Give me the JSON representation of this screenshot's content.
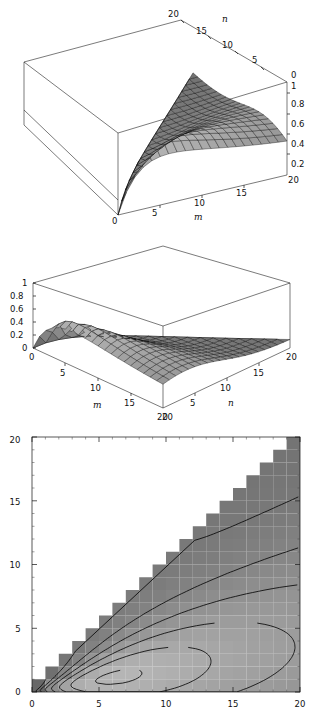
{
  "figure": {
    "title": "",
    "panel_count": 3,
    "background": "#ffffff",
    "line_color": "#111111"
  },
  "chart_data": [
    {
      "id": "surface-top",
      "type": "surface3d",
      "title": "",
      "xlabel": "m",
      "ylabel": "n",
      "zlabel": "",
      "xlim": [
        0,
        20
      ],
      "ylim": [
        0,
        20
      ],
      "zlim": [
        0,
        1
      ],
      "xticks": [
        0,
        5,
        10,
        15,
        20
      ],
      "yticks": [
        20,
        15,
        10,
        5,
        0
      ],
      "zticks": [
        0.2,
        0.4,
        0.6,
        0.8,
        1
      ],
      "xtick_labels": [
        "0",
        "5",
        "10",
        "15",
        "20"
      ],
      "ytick_labels": [
        "20",
        "15",
        "10",
        "5",
        "0"
      ],
      "ztick_labels": [
        "0.2",
        "0.4",
        "0.6",
        "0.8",
        "1"
      ],
      "grid": true,
      "legend": "none",
      "mesh": [
        20,
        20
      ],
      "shading": "grayscale",
      "description": "Ridge surface rising from front-left origin to a crest then decaying toward the far right; surface defined only where n is less than or equal to m.",
      "corner_labels": {
        "z_top": "0",
        "z_bottom": "20"
      }
    },
    {
      "id": "surface-middle",
      "type": "surface3d",
      "title": "",
      "xlabel": "m",
      "ylabel": "n",
      "zlabel": "",
      "xlim": [
        0,
        20
      ],
      "ylim": [
        0,
        20
      ],
      "zlim": [
        0,
        1
      ],
      "xticks": [
        0,
        5,
        10,
        15,
        20
      ],
      "yticks": [
        0,
        5,
        10,
        15,
        20
      ],
      "zticks": [
        0,
        0.2,
        0.4,
        0.6,
        0.8,
        1
      ],
      "xtick_labels": [
        "0",
        "5",
        "10",
        "15",
        "20"
      ],
      "ytick_labels": [
        "20",
        "5",
        "10",
        "15",
        "20"
      ],
      "ztick_labels": [
        "0",
        "0.2",
        "0.4",
        "0.6",
        "0.8",
        "1"
      ],
      "grid": true,
      "legend": "none",
      "mesh": [
        20,
        20
      ],
      "shading": "grayscale",
      "description": "Same surface viewed from the opposite azimuth; steep rise at the left corner flattening into a broad plateau sloping gently to the right."
    },
    {
      "id": "contour-bottom",
      "type": "contour",
      "title": "",
      "xlabel": "",
      "ylabel": "",
      "xlim": [
        0,
        20
      ],
      "ylim": [
        0,
        20
      ],
      "xticks": [
        0,
        5,
        10,
        15,
        20
      ],
      "yticks": [
        0,
        5,
        10,
        15,
        20
      ],
      "xtick_labels": [
        "0",
        "5",
        "10",
        "15",
        "20"
      ],
      "ytick_labels": [
        "0",
        "5",
        "10",
        "15",
        "20"
      ],
      "minor_ticks": true,
      "grid": false,
      "legend": "none",
      "shading": "grayscale",
      "levels": 12,
      "domain_note": "Shaded only in the lower triangular region where n is less than or equal to m; blank white above the diagonal.",
      "description": "Density plot with U-shaped contour lines opening upward centred near m=10, light (high) band near m=8-11, dark (low) values at small m and at large m."
    }
  ],
  "labels": {
    "m": "m",
    "n": "n",
    "zero": "0",
    "five": "5",
    "ten": "10",
    "fifteen": "15",
    "twenty": "20",
    "p2": "0.2",
    "p4": "0.4",
    "p6": "0.6",
    "p8": "0.8",
    "one": "1"
  }
}
